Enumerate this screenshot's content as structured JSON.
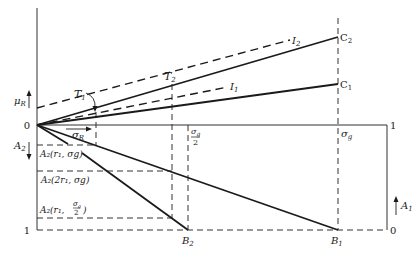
{
  "figure": {
    "labels": {
      "origin": "0",
      "mu_r": "μ",
      "mu_r_sub": "R",
      "a2": "A",
      "a2_sub": "2",
      "a1": "A",
      "a1_sub": "1",
      "sigma_r": "σ",
      "sigma_r_sub": "R",
      "sigma_g": "σ",
      "sigma_g_sub": "g",
      "sigma_g_half_num": "σ",
      "sigma_g_half_num_sub": "g",
      "sigma_g_half_den": "2",
      "t1": "T",
      "t1_sub": "1",
      "t2": "T",
      "t2_sub": "2",
      "i1": "I",
      "i1_sub": "1",
      "i2": "I",
      "i2_sub": "2",
      "c1": "C",
      "c1_sub": "1",
      "c2": "C",
      "c2_sub": "2",
      "b1": "B",
      "b1_sub": "1",
      "b2": "B",
      "b2_sub": "2",
      "right_top": "1",
      "right_bottom": "0",
      "left_bottom": "1",
      "a2_r1_sg": "A₂(r₁, σg)",
      "a2_2r1_sg": "A₂(2r₁, σg)",
      "a2_r1_sg2_prefix": "A₂(r₁,",
      "a2_r1_sg2_suffix": ")"
    }
  }
}
